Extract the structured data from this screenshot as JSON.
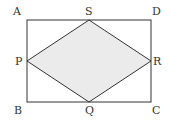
{
  "diagram": {
    "type": "geometry",
    "rectangle": {
      "vertices": [
        "A",
        "B",
        "C",
        "D"
      ]
    },
    "rhombus": {
      "vertices": [
        "P",
        "Q",
        "R",
        "S"
      ],
      "shaded": true
    },
    "labels": {
      "A": "A",
      "B": "B",
      "C": "C",
      "D": "D",
      "P": "P",
      "Q": "Q",
      "R": "R",
      "S": "S"
    },
    "colors": {
      "stroke": "#333333",
      "fill": "#ebebeb"
    }
  }
}
